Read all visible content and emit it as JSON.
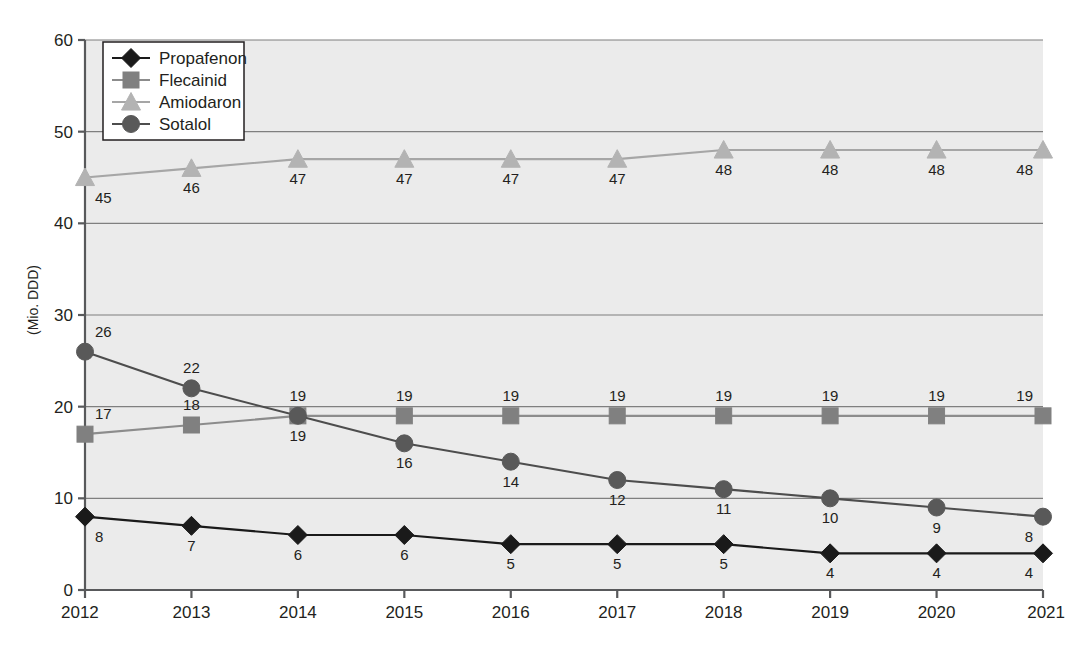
{
  "chart_data": {
    "type": "line",
    "title": "",
    "xlabel": "",
    "ylabel": "(Mio. DDD)",
    "categories": [
      "2012",
      "2013",
      "2014",
      "2015",
      "2016",
      "2017",
      "2018",
      "2019",
      "2020",
      "2021"
    ],
    "ylim": [
      0,
      60
    ],
    "yticks": [
      "0",
      "10",
      "20",
      "30",
      "40",
      "50",
      "60"
    ],
    "grid": "horizontal",
    "legend_position": "top-left-inside",
    "series": [
      {
        "name": "Propafenon",
        "marker": "diamond",
        "color": "#1a1a1a",
        "line_color": "#1a1a1a",
        "values": [
          8,
          7,
          6,
          6,
          5,
          5,
          5,
          4,
          4,
          4
        ],
        "label_positions": [
          "below",
          "below",
          "below",
          "below",
          "below",
          "below",
          "below",
          "below",
          "below",
          "below"
        ]
      },
      {
        "name": "Flecainid",
        "marker": "square",
        "color": "#808080",
        "line_color": "#8c8c8c",
        "values": [
          17,
          18,
          19,
          19,
          19,
          19,
          19,
          19,
          19,
          19
        ],
        "label_positions": [
          "above",
          "above",
          "above",
          "above",
          "above",
          "above",
          "above",
          "above",
          "above",
          "above"
        ]
      },
      {
        "name": "Amiodaron",
        "marker": "triangle",
        "color": "#b3b3b3",
        "line_color": "#a6a6a6",
        "values": [
          45,
          46,
          47,
          47,
          47,
          47,
          48,
          48,
          48,
          48
        ],
        "label_positions": [
          "below",
          "below",
          "below",
          "below",
          "below",
          "below",
          "below",
          "below",
          "below",
          "below"
        ]
      },
      {
        "name": "Sotalol",
        "marker": "circle",
        "color": "#595959",
        "line_color": "#4d4d4d",
        "values": [
          26,
          22,
          19,
          16,
          14,
          12,
          11,
          10,
          9,
          8
        ],
        "label_positions": [
          "above",
          "above",
          "below",
          "below",
          "below",
          "below",
          "below",
          "below",
          "below",
          "below"
        ]
      }
    ]
  },
  "colors": {
    "plot_background": "#ebebeb",
    "gridline": "#7f7f7f",
    "axis": "#58595b",
    "page_background": "#ffffff",
    "text": "#231f20",
    "legend_background": "#ffffff",
    "legend_border": "#231f20"
  },
  "legend": {
    "items": [
      {
        "label": "Propafenon"
      },
      {
        "label": "Flecainid"
      },
      {
        "label": "Amiodaron"
      },
      {
        "label": "Sotalol"
      }
    ]
  }
}
